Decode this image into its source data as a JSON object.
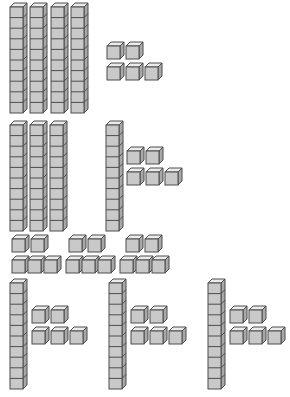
{
  "palette": {
    "front_face": "#c9c9c9",
    "top_face": "#ebebeb",
    "side_face": "#a8a8a8",
    "outline": "#4d4d4d",
    "background": "#ffffff"
  },
  "legend": {
    "rod_name": "ten-rod",
    "cube_name": "unit-cube",
    "rod_value": 10,
    "cube_value": 1
  },
  "geometry": {
    "cube_size": 13,
    "depth": 4,
    "rod_segments": 10,
    "rod_width": 13,
    "rod_segment_height": 10.6
  },
  "groups": [
    {
      "id": "group-1",
      "label": "Group 1",
      "rods": 4,
      "cubes": 5,
      "value": 45,
      "rod_positions": [
        {
          "x": 9,
          "y": 2
        },
        {
          "x": 29,
          "y": 2
        },
        {
          "x": 50,
          "y": 2
        },
        {
          "x": 70,
          "y": 2
        }
      ],
      "cube_rows": [
        {
          "y": 41,
          "x_positions": [
            106,
            125
          ]
        },
        {
          "y": 62,
          "x_positions": [
            106,
            125,
            144
          ]
        }
      ]
    },
    {
      "id": "group-2",
      "label": "Group 2",
      "rods": 3,
      "cubes": 0,
      "value": 30,
      "rod_positions": [
        {
          "x": 9,
          "y": 120
        },
        {
          "x": 29,
          "y": 120
        },
        {
          "x": 49,
          "y": 120
        }
      ],
      "cube_rows": []
    },
    {
      "id": "group-3",
      "label": "Group 3",
      "rods": 1,
      "cubes": 5,
      "value": 15,
      "rod_positions": [
        {
          "x": 105,
          "y": 120
        }
      ],
      "cube_rows": [
        {
          "y": 146,
          "x_positions": [
            126,
            145
          ]
        },
        {
          "y": 167,
          "x_positions": [
            126,
            145,
            164
          ]
        }
      ]
    },
    {
      "id": "group-4",
      "label": "Group 4 (loose units row A)",
      "rods": 0,
      "cubes": 6,
      "value": 6,
      "rod_positions": [],
      "cube_rows": [
        {
          "y": 234,
          "x_positions": [
            11,
            30,
            68,
            87,
            125,
            144
          ]
        }
      ]
    },
    {
      "id": "group-5",
      "label": "Group 5 (loose units row B)",
      "rods": 0,
      "cubes": 9,
      "value": 9,
      "rod_positions": [],
      "cube_rows": [
        {
          "y": 255,
          "x_positions": [
            11,
            27,
            43,
            65,
            81,
            97,
            119,
            135,
            151
          ]
        }
      ]
    },
    {
      "id": "group-6",
      "label": "Group 6",
      "rods": 1,
      "cubes": 5,
      "value": 15,
      "rod_positions": [
        {
          "x": 9,
          "y": 278
        }
      ],
      "cube_rows": [
        {
          "y": 305,
          "x_positions": [
            31,
            50
          ]
        },
        {
          "y": 326,
          "x_positions": [
            31,
            50,
            69
          ]
        }
      ]
    },
    {
      "id": "group-7",
      "label": "Group 7",
      "rods": 1,
      "cubes": 5,
      "value": 15,
      "rod_positions": [
        {
          "x": 108,
          "y": 278
        }
      ],
      "cube_rows": [
        {
          "y": 305,
          "x_positions": [
            130,
            149
          ]
        },
        {
          "y": 326,
          "x_positions": [
            130,
            149,
            168
          ]
        }
      ]
    },
    {
      "id": "group-8",
      "label": "Group 8",
      "rods": 1,
      "cubes": 5,
      "value": 15,
      "rod_positions": [
        {
          "x": 207,
          "y": 278
        }
      ],
      "cube_rows": [
        {
          "y": 305,
          "x_positions": [
            229,
            248
          ]
        },
        {
          "y": 326,
          "x_positions": [
            229,
            248,
            267
          ]
        }
      ]
    }
  ],
  "totals": {
    "total_rods": 11,
    "total_cubes": 35,
    "total_value": 145
  }
}
